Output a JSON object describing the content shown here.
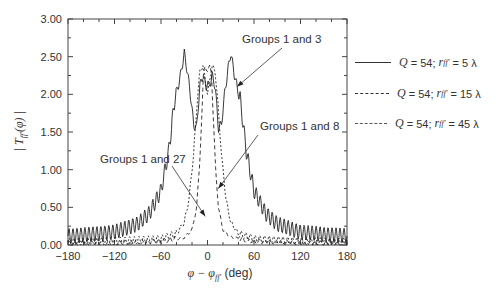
{
  "chart_data": {
    "type": "line",
    "title": "",
    "xlabel": "φ − φ_ff′ (deg)",
    "ylabel": "|T_ff′(φ)|",
    "xlim": [
      -180,
      180
    ],
    "ylim": [
      0,
      3.0
    ],
    "x_ticks": [
      "-180",
      "-120",
      "-60",
      "0",
      "60",
      "120",
      "180"
    ],
    "y_ticks": [
      "0.00",
      "0.50",
      "1.00",
      "1.50",
      "2.00",
      "2.50",
      "3.00"
    ],
    "grid": false,
    "legend_position": "right-outside",
    "series": [
      {
        "name": "Q = 54; r_ff′ = 5 λ",
        "style": "solid",
        "annotation": "Groups 1 and 3",
        "x": [
          -180,
          -150,
          -120,
          -90,
          -75,
          -60,
          -50,
          -42,
          -38,
          -34,
          -30,
          -26,
          -22,
          -18,
          -14,
          -10,
          -6,
          -2,
          0,
          2,
          6,
          10,
          14,
          18,
          22,
          26,
          30,
          34,
          38,
          42,
          50,
          60,
          75,
          90,
          120,
          150,
          180
        ],
        "y": [
          0.12,
          0.14,
          0.17,
          0.28,
          0.42,
          0.72,
          1.25,
          1.95,
          2.1,
          2.3,
          2.55,
          2.3,
          2.0,
          1.6,
          1.55,
          2.1,
          2.25,
          2.1,
          2.15,
          2.1,
          2.25,
          2.1,
          1.55,
          1.6,
          2.0,
          2.3,
          2.55,
          2.3,
          2.1,
          1.95,
          1.25,
          0.72,
          0.42,
          0.28,
          0.17,
          0.14,
          0.12
        ]
      },
      {
        "name": "Q = 54; r_ff′ = 15 λ",
        "style": "dotted",
        "annotation": "Groups 1 and 8",
        "x": [
          -180,
          -120,
          -60,
          -40,
          -30,
          -24,
          -18,
          -14,
          -10,
          -6,
          -3,
          0,
          3,
          6,
          10,
          14,
          18,
          24,
          30,
          40,
          60,
          120,
          180
        ],
        "y": [
          0.04,
          0.05,
          0.08,
          0.15,
          0.3,
          0.6,
          1.2,
          1.8,
          2.3,
          2.38,
          2.2,
          2.0,
          2.2,
          2.38,
          2.3,
          1.8,
          1.2,
          0.6,
          0.3,
          0.15,
          0.08,
          0.05,
          0.04
        ]
      },
      {
        "name": "Q = 54; r_ff′ = 45 λ",
        "style": "dashed",
        "annotation": "Groups 1 and 27",
        "x": [
          -180,
          -120,
          -60,
          -30,
          -20,
          -14,
          -10,
          -7,
          -5,
          -3,
          0,
          3,
          5,
          7,
          10,
          14,
          20,
          30,
          60,
          120,
          180
        ],
        "y": [
          0.02,
          0.03,
          0.05,
          0.1,
          0.2,
          0.5,
          1.1,
          1.8,
          2.3,
          2.38,
          2.3,
          2.38,
          2.3,
          1.8,
          1.1,
          0.5,
          0.2,
          0.1,
          0.05,
          0.03,
          0.02
        ]
      }
    ],
    "annotations": [
      {
        "text": "Groups 1 and 3",
        "x": 38,
        "y": 2.1
      },
      {
        "text": "Groups 1 and 8",
        "x": 14,
        "y": 0.75
      },
      {
        "text": "Groups 1 and 27",
        "x": -3,
        "y": 0.38
      }
    ]
  },
  "legend": [
    {
      "q": "Q",
      "q_val": "= 54;",
      "r": "r",
      "sub": "ff′",
      "r_val": "= 5 λ",
      "style": "solid"
    },
    {
      "q": "Q",
      "q_val": "= 54;",
      "r": "r",
      "sub": "ff′",
      "r_val": "= 15 λ",
      "style": "dotted"
    },
    {
      "q": "Q",
      "q_val": "= 54;",
      "r": "r",
      "sub": "ff′",
      "r_val": "= 45 λ",
      "style": "dashed"
    }
  ],
  "axis": {
    "xlabel_main": "φ − φ",
    "xlabel_sub": "ff′",
    "xlabel_unit": "(deg)",
    "ylabel_main": "| T",
    "ylabel_sub": "ff′",
    "ylabel_arg": "(φ) |"
  }
}
